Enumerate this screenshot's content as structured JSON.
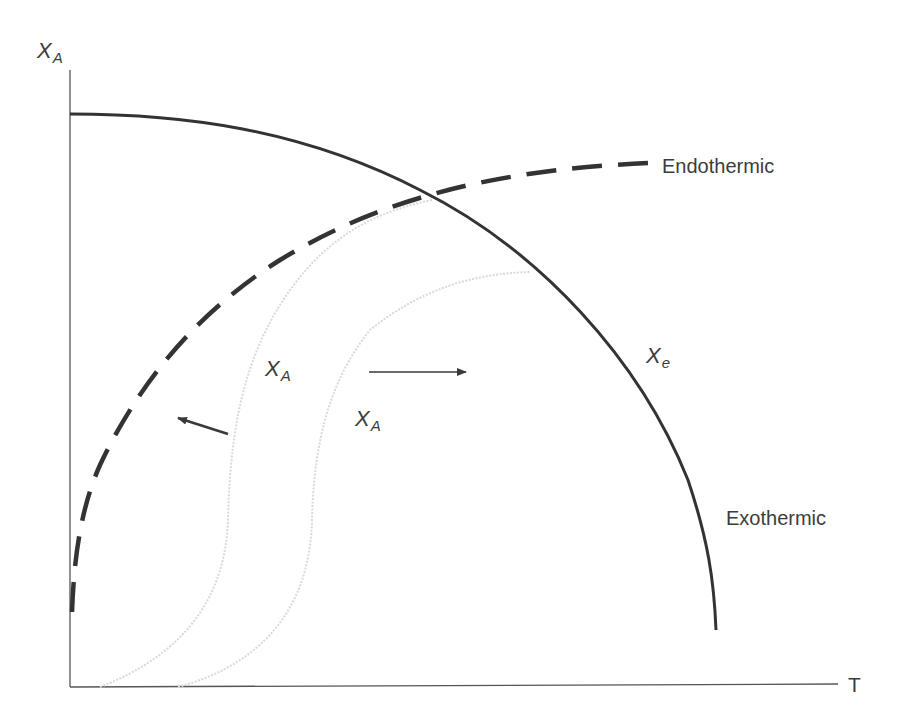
{
  "diagram": {
    "type": "conversion-temperature diagram",
    "axes": {
      "y_label": {
        "main": "X",
        "sub": "A"
      },
      "x_label": "T"
    },
    "curves": [
      {
        "id": "equilibrium-exothermic",
        "style": "solid",
        "color": "#333333",
        "label": {
          "main": "X",
          "sub": "e"
        },
        "annotation": "Exothermic"
      },
      {
        "id": "equilibrium-endothermic",
        "style": "dashed",
        "color": "#333333",
        "annotation": "Endothermic"
      },
      {
        "id": "rate-curve-1",
        "style": "faint",
        "color": "#d8d8d8",
        "label": {
          "main": "X",
          "sub": "A"
        }
      },
      {
        "id": "rate-curve-2",
        "style": "faint",
        "color": "#d8d8d8",
        "label": {
          "main": "X",
          "sub": "A"
        }
      }
    ],
    "arrows": [
      {
        "id": "arrow-left",
        "direction": "up-left"
      },
      {
        "id": "arrow-right",
        "direction": "right"
      }
    ]
  },
  "labels": {
    "y_axis_main": "X",
    "y_axis_sub": "A",
    "x_axis": "T",
    "endothermic": "Endothermic",
    "exothermic": "Exothermic",
    "xe_main": "X",
    "xe_sub": "e",
    "xa1_main": "X",
    "xa1_sub": "A",
    "xa2_main": "X",
    "xa2_sub": "A"
  }
}
